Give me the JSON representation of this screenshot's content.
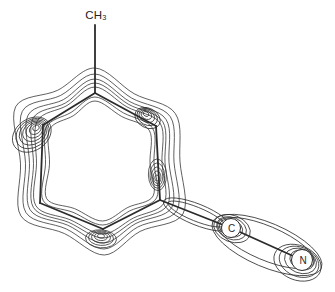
{
  "figure": {
    "background": "#ffffff",
    "line_color": "#2b2b2b",
    "contour_stroke_width": 0.75,
    "skeleton_stroke_width": 1.8,
    "labels": {
      "methyl": "CH₃",
      "carbon": "C",
      "nitrogen": "N"
    },
    "canvas": {
      "width": 335,
      "height": 292
    },
    "skeleton_bonds": [
      {
        "name": "methyl-bond",
        "x1": 95,
        "y1": 25,
        "x2": 95,
        "y2": 93
      },
      {
        "name": "ring-bond-top-right",
        "x1": 95,
        "y1": 93,
        "x2": 156,
        "y2": 126
      },
      {
        "name": "ring-bond-right",
        "x1": 156,
        "y1": 126,
        "x2": 160,
        "y2": 200
      },
      {
        "name": "ring-bond-bottom-right",
        "x1": 160,
        "y1": 200,
        "x2": 103,
        "y2": 229
      },
      {
        "name": "ring-bond-bottom-left",
        "x1": 103,
        "y1": 229,
        "x2": 40,
        "y2": 203
      },
      {
        "name": "ring-bond-left",
        "x1": 40,
        "y1": 203,
        "x2": 43,
        "y2": 125
      },
      {
        "name": "ring-bond-top-left",
        "x1": 43,
        "y1": 125,
        "x2": 95,
        "y2": 93
      },
      {
        "name": "exo-bond-ring-c",
        "x1": 160,
        "y1": 200,
        "x2": 231,
        "y2": 228
      },
      {
        "name": "exo-bond-c-n",
        "x1": 231,
        "y1": 228,
        "x2": 302,
        "y2": 260
      }
    ],
    "ring_contours": {
      "anchors": [
        {
          "x": 95,
          "y": 93,
          "nx": 0,
          "ny": -1
        },
        {
          "x": 125.5,
          "y": 109.5,
          "nx": 0.475,
          "ny": -0.88
        },
        {
          "x": 156,
          "y": 126,
          "nx": 0.84,
          "ny": -0.545
        },
        {
          "x": 158,
          "y": 163,
          "nx": 0.999,
          "ny": -0.054
        },
        {
          "x": 160,
          "y": 200,
          "nx": 0.85,
          "ny": 0.52
        },
        {
          "x": 131.5,
          "y": 214.5,
          "nx": 0.45,
          "ny": 0.89
        },
        {
          "x": 103,
          "y": 229,
          "nx": 0.05,
          "ny": 1
        },
        {
          "x": 71.5,
          "y": 216,
          "nx": -0.38,
          "ny": 0.92
        },
        {
          "x": 40,
          "y": 203,
          "nx": -0.83,
          "ny": 0.56
        },
        {
          "x": 41.5,
          "y": 164,
          "nx": -0.9995,
          "ny": -0.038
        },
        {
          "x": 43,
          "y": 125,
          "nx": -0.83,
          "ny": -0.55
        },
        {
          "x": 69,
          "y": 109,
          "nx": -0.52,
          "ny": -0.85
        }
      ],
      "loops": [
        [
          -8,
          -8,
          -8,
          -8,
          -8,
          -8,
          -8,
          -8,
          -8,
          -8,
          -8,
          -8
        ],
        [
          -4,
          -4,
          -4,
          -4,
          -4,
          -4,
          -4,
          -4,
          -4,
          -4,
          -4,
          -4
        ],
        [
          6,
          3,
          5,
          4,
          5,
          4,
          5,
          4,
          5,
          5,
          7,
          4
        ],
        [
          10,
          6,
          8,
          7,
          9,
          7,
          9,
          7,
          8,
          8,
          12,
          7
        ],
        [
          14,
          9,
          12,
          11,
          14,
          10,
          14,
          10,
          12,
          12,
          18,
          11
        ],
        [
          19,
          13,
          17,
          16,
          20,
          14,
          20,
          14,
          17,
          16,
          25,
          16
        ],
        [
          25,
          18,
          23,
          22,
          27,
          19,
          26,
          19,
          23,
          21,
          33,
          22
        ]
      ]
    },
    "contour_nests": [
      {
        "name": "upper-left-bond-nest",
        "cx": 36,
        "cy": 128,
        "rot": -35,
        "n": 7,
        "rx0": 3.5,
        "ry0": 2.6,
        "drx": 2.9,
        "dry": 2.2,
        "dx": -0.7,
        "dy": 1.1
      },
      {
        "name": "upper-right-bond-nest",
        "cx": 146,
        "cy": 114,
        "rot": 28,
        "n": 5,
        "rx0": 3,
        "ry0": 2.2,
        "drx": 2.6,
        "dry": 1.9,
        "dx": 0.4,
        "dy": 1.0
      },
      {
        "name": "right-bond-nest",
        "cx": 157,
        "cy": 178,
        "rot": 88,
        "n": 5,
        "rx0": 3,
        "ry0": 2.2,
        "drx": 3.2,
        "dry": 1.7,
        "dx": 0.1,
        "dy": -0.8
      },
      {
        "name": "bottom-bond-nest",
        "cx": 101,
        "cy": 236,
        "rot": 4,
        "n": 5,
        "rx0": 3.5,
        "ry0": 2.2,
        "drx": 3.0,
        "dry": 1.7,
        "dx": 0,
        "dy": 0.7
      },
      {
        "name": "ring-to-c-neck",
        "cx": 196,
        "cy": 214,
        "rot": 22,
        "n": 2,
        "rx0": 30,
        "ry0": 7,
        "drx": 6,
        "dry": 3.5,
        "dx": 1,
        "dy": 0.5
      },
      {
        "name": "c-atom-nest",
        "cx": 231,
        "cy": 228,
        "rot": 22,
        "n": 3,
        "rx0": 12,
        "ry0": 8.5,
        "drx": 3.5,
        "dry": 2.4,
        "dx": 0.5,
        "dy": 0.3
      },
      {
        "name": "n-atom-nest",
        "cx": 302,
        "cy": 260,
        "rot": 22,
        "n": 4,
        "rx0": 12.5,
        "ry0": 9.5,
        "drx": 4,
        "dry": 2.6,
        "dx": -1.5,
        "dy": 0.9
      },
      {
        "name": "c-n-peanut",
        "cx": 266,
        "cy": 243,
        "rot": 23,
        "n": 2,
        "rx0": 52,
        "ry0": 17,
        "drx": 7,
        "dry": 5,
        "dx": 1,
        "dy": 2
      }
    ],
    "atom_markers": [
      {
        "name": "carbon",
        "x": 231,
        "y": 228,
        "r": 9.5
      },
      {
        "name": "nitrogen",
        "x": 302,
        "y": 260,
        "r": 10.5
      }
    ],
    "label_positions": {
      "methyl": {
        "x": 96,
        "y": 10
      },
      "carbon": {
        "x": 231,
        "y": 228
      },
      "nitrogen": {
        "x": 303,
        "y": 260
      }
    }
  }
}
